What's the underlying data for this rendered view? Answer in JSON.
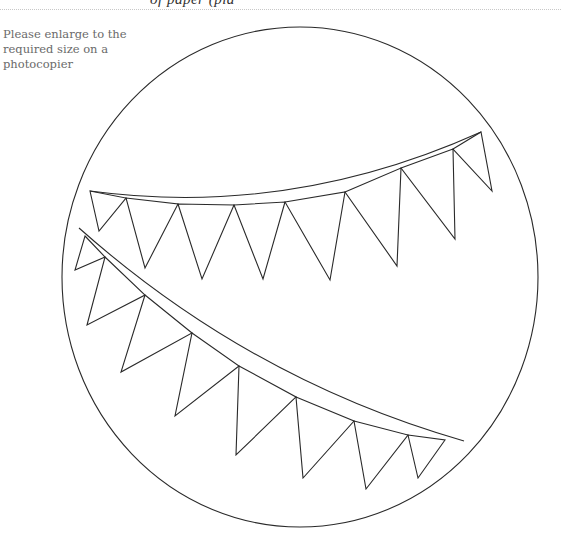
{
  "header": {
    "cut_off_title": "of paper (pla",
    "rule_color": "#c8c8c8"
  },
  "instruction": {
    "text": "Please enlarge to the required size on a photocopier"
  },
  "template": {
    "stroke_color": "#2a2a2a",
    "circle": {
      "cx": 300,
      "cy": 277,
      "rx": 238,
      "ry": 250
    },
    "upper_bunting": {
      "string_path": "M90,191 Q290,218 481,132",
      "pennants": [
        {
          "points": "90,191 126,198 99,231"
        },
        {
          "points": "126,198 178,204 145,268"
        },
        {
          "points": "178,204 234,205 202,279"
        },
        {
          "points": "234,205 285,202 263,279"
        },
        {
          "points": "285,202 345,192 330,280"
        },
        {
          "points": "345,192 401,168 397,266"
        },
        {
          "points": "401,168 453,149 455,239"
        },
        {
          "points": "453,149 481,132 492,191"
        }
      ]
    },
    "lower_bunting": {
      "string_path": "M79,228 Q250,380 464,441",
      "pennants": [
        {
          "points": "85,236 105,257 75,270"
        },
        {
          "points": "105,257 145,295 87,325"
        },
        {
          "points": "145,295 192,333 121,372"
        },
        {
          "points": "192,333 239,366 175,416"
        },
        {
          "points": "239,366 296,397 236,455"
        },
        {
          "points": "296,397 354,421 303,478"
        },
        {
          "points": "354,421 408,435 366,489"
        },
        {
          "points": "408,435 445,440 418,478"
        }
      ]
    }
  }
}
